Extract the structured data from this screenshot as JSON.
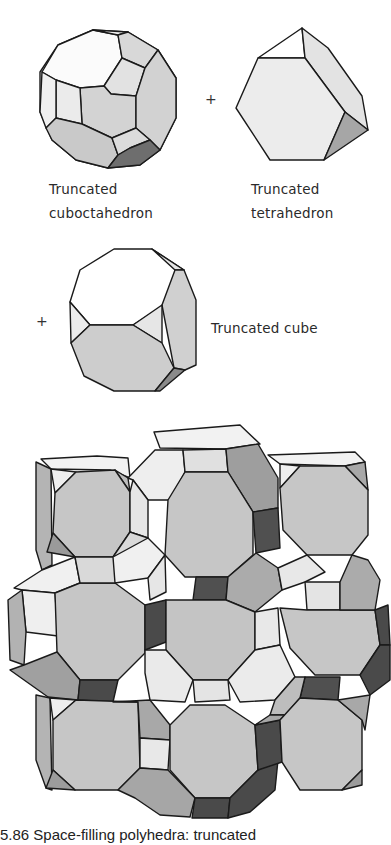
{
  "figure": {
    "components": [
      {
        "id": "truncated-cuboctahedron",
        "label_lines": [
          "Truncated",
          "cuboctahedron"
        ]
      },
      {
        "id": "truncated-tetrahedron",
        "label_lines": [
          "Truncated",
          "tetrahedron"
        ]
      },
      {
        "id": "truncated-cube",
        "label_lines": [
          "Truncated cube"
        ]
      }
    ],
    "operators": [
      "+",
      "+"
    ],
    "composite": {
      "id": "space-filling-honeycomb"
    },
    "caption": "5.86  Space-filling polyhedra: truncated"
  },
  "palette": {
    "white_face": "#f7f7f7",
    "light_face": "#e6e6e6",
    "mid_face": "#c8c8c8",
    "gray_face": "#a9a9a9",
    "dark_face": "#4a4a4a",
    "edge": "#1a1a1a"
  }
}
